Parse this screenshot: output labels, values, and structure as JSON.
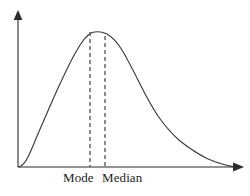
{
  "figure": {
    "name": "right-skewed-distribution-diagram",
    "background_color": "#ffffff",
    "width": 250,
    "height": 196
  },
  "axes": {
    "x_axis": {
      "icon": "arrow-right-icon",
      "color": "#2b2b2b",
      "origin_x": 18,
      "origin_y": 167,
      "end_x": 243,
      "tick_labels": [],
      "title": ""
    },
    "y_axis": {
      "icon": "arrow-up-icon",
      "color": "#2b2b2b",
      "origin_x": 18,
      "origin_y": 167,
      "end_y": 11,
      "tick_labels": [],
      "title": ""
    }
  },
  "markers": [
    {
      "id": "mode",
      "label": "Mode",
      "x": 90,
      "top_y": 32,
      "bottom_y": 167,
      "style": "dashed",
      "color": "#4a4a4a",
      "label_x": 63,
      "label_y": 171
    },
    {
      "id": "median",
      "label": "Median",
      "x": 105,
      "top_y": 36,
      "bottom_y": 167,
      "style": "dashed",
      "color": "#4a4a4a",
      "label_x": 102,
      "label_y": 171
    }
  ],
  "chart_data": {
    "type": "line",
    "title": "",
    "subtitle": "",
    "xlabel": "",
    "ylabel": "",
    "grid": false,
    "legend": null,
    "curve_name": "right-skewed-density-curve",
    "curve_color": "#3a3a3a",
    "xlim": [
      18,
      243
    ],
    "ylim": [
      167,
      31
    ],
    "annotations": [
      "Mode",
      "Median"
    ],
    "x": [
      18,
      26,
      34,
      42,
      50,
      58,
      66,
      74,
      82,
      90,
      98,
      106,
      114,
      122,
      130,
      138,
      146,
      154,
      162,
      170,
      178,
      186,
      194,
      202,
      210,
      218,
      226,
      234
    ],
    "y": [
      167,
      160,
      148,
      133,
      116,
      98,
      80,
      64,
      48,
      37,
      32,
      33,
      38,
      47,
      60,
      74,
      88,
      101,
      112,
      122,
      131,
      139,
      146,
      152,
      157,
      161,
      164,
      166
    ],
    "path_d": "M 19,167 C 22,166 25,163 28,157 C 32,149 36,138 41,127 C 47,113 53,99 59,86 C 65,73 71,60 77,50 C 82,41 87,35 92,32.5 C 97,31.2 102,31.6 107,34 C 112,36.8 117,42 122,50 C 128,60 134,72 140,84 C 146,96 152,107 158,116 C 165,126 172,134 180,141 C 189,148 198,154 207,158.5 C 215,162 224,165 233,166.6"
  },
  "labels": {
    "mode": "Mode",
    "median": "Median"
  }
}
